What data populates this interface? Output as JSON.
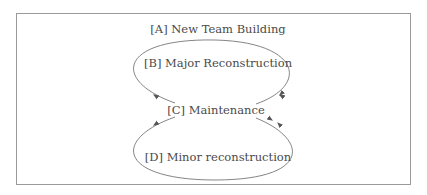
{
  "diagram": {
    "nodes": [
      {
        "id": "A",
        "label": "[A] New Team Building"
      },
      {
        "id": "B",
        "label": "[B] Major Reconstruction"
      },
      {
        "id": "C",
        "label": "[C] Maintenance"
      },
      {
        "id": "D",
        "label": "[D] Minor reconstruction"
      }
    ],
    "edges": [
      {
        "from": "C",
        "to": "B",
        "path": "upper-left arc"
      },
      {
        "from": "B",
        "to": "C",
        "path": "upper-right arc"
      },
      {
        "from": "C",
        "to": "D",
        "path": "lower-left arc"
      },
      {
        "from": "D",
        "to": "C",
        "path": "lower-right arc"
      }
    ],
    "colors": {
      "line": "#555555",
      "text": "#4a4a4a",
      "frame": "#9a9a9a"
    }
  }
}
